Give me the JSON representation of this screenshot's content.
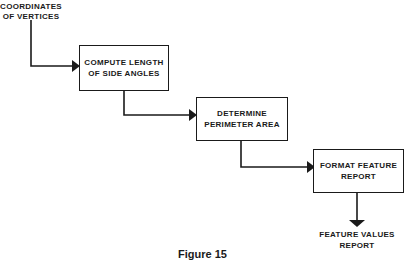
{
  "diagram": {
    "input_label": "COORDINATES\nOF VERTICES",
    "steps": [
      {
        "label": "COMPUTE LENGTH\nOF SIDE ANGLES"
      },
      {
        "label": "DETERMINE\nPERIMETER AREA"
      },
      {
        "label": "FORMAT FEATURE\nREPORT"
      }
    ],
    "output_label": "FEATURE VALUES\nREPORT",
    "caption": "Figure 15",
    "line_color": "#1a1a1a"
  }
}
